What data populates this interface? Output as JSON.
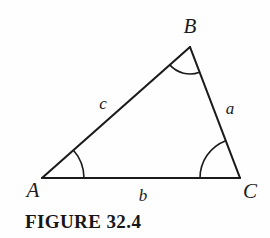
{
  "figure": {
    "caption": "FIGURE 32.4",
    "background_color": "#fefefe",
    "stroke_color": "#1b1b1b",
    "label_color": "#1b1b1b"
  },
  "diagram": {
    "type": "triangle",
    "vertices": [
      {
        "name": "A",
        "label": "A",
        "x": 42,
        "y": 178,
        "label_x": 33,
        "label_y": 190
      },
      {
        "name": "B",
        "label": "B",
        "x": 190,
        "y": 47,
        "label_x": 190,
        "label_y": 26
      },
      {
        "name": "C",
        "label": "C",
        "x": 240,
        "y": 178,
        "label_x": 250,
        "label_y": 191
      }
    ],
    "sides": [
      {
        "name": "a",
        "label": "a",
        "from": "B",
        "to": "C",
        "label_x": 230,
        "label_y": 108
      },
      {
        "name": "b",
        "label": "b",
        "from": "A",
        "to": "C",
        "label_x": 143,
        "label_y": 195
      },
      {
        "name": "c",
        "label": "c",
        "from": "A",
        "to": "B",
        "label_x": 103,
        "label_y": 103
      }
    ],
    "angle_arcs": [
      {
        "at": "A",
        "radius": 42
      },
      {
        "at": "B",
        "radius": 27
      },
      {
        "at": "C",
        "radius": 40
      }
    ]
  }
}
